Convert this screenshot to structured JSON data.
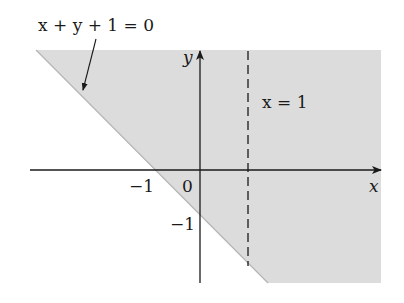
{
  "diagram": {
    "colors": {
      "shade": "#dcdcdc",
      "axis": "#1a1a1a",
      "boundary_line": "#9a9a9a",
      "dashed_line": "#1a1a1a",
      "background": "#ffffff"
    },
    "labels": {
      "line_equation": "x + y + 1 = 0",
      "vertical_line": "x = 1",
      "x_axis": "x",
      "y_axis": "y",
      "origin": "0",
      "x_tick_neg1": "−1",
      "y_tick_neg1": "−1"
    },
    "axes": {
      "x_axis_label": "x",
      "y_axis_label": "y",
      "x_ticks": [
        "−1",
        "0"
      ],
      "y_ticks": [
        "−1"
      ]
    },
    "elements": {
      "shaded_region": "half-plane x + y + 1 >= 0 (above/right of line)",
      "solid_line": "x + y + 1 = 0",
      "dashed_line": "x = 1",
      "annotation_arrow": "points from equation label to line"
    }
  }
}
